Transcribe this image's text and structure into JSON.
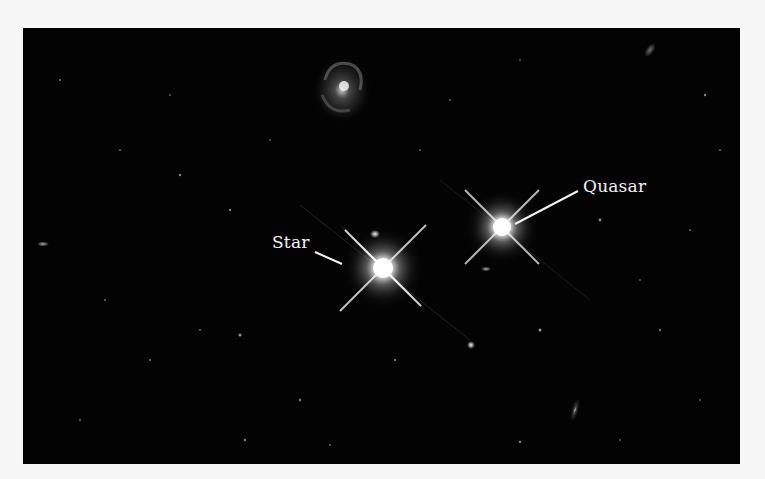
{
  "figure": {
    "background_color": "#030303",
    "border_color": "#f7f7f7",
    "labels": {
      "star": "Star",
      "quasar": "Quasar"
    },
    "objects": [
      {
        "name": "star",
        "x": 383,
        "y": 268,
        "type": "point-source-with-spikes"
      },
      {
        "name": "quasar",
        "x": 502,
        "y": 227,
        "type": "point-source-with-spikes"
      },
      {
        "name": "spiral-galaxy",
        "x": 342,
        "y": 88,
        "type": "galaxy"
      },
      {
        "name": "edge-on-galaxy",
        "x": 575,
        "y": 410,
        "type": "galaxy"
      }
    ]
  }
}
